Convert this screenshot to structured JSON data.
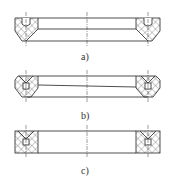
{
  "figure": {
    "type": "seal-ring-cross-sections",
    "line_color": "#3a3a3a",
    "hatch_color": "#555555",
    "panels": [
      {
        "id": "a",
        "label": "a)",
        "profile": "chamfered-bottom-with-top-groove"
      },
      {
        "id": "b",
        "label": "b)",
        "profile": "chamfered-both-with-center-square"
      },
      {
        "id": "c",
        "label": "c)",
        "profile": "rectangular-with-center-square"
      }
    ]
  }
}
